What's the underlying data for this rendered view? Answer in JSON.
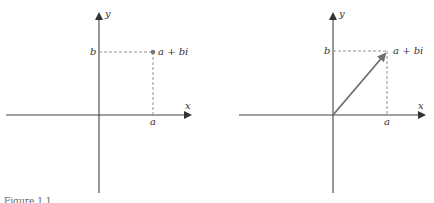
{
  "figure": {
    "caption_partial": "Figure 1.1",
    "panels": [
      {
        "id": "point-representation",
        "x_axis_label": "x",
        "y_axis_label": "y",
        "real_tick_label": "a",
        "imag_tick_label": "b",
        "point_label": "a + bi",
        "representation": "point"
      },
      {
        "id": "vector-representation",
        "x_axis_label": "x",
        "y_axis_label": "y",
        "real_tick_label": "a",
        "imag_tick_label": "b",
        "point_label": "a + bi",
        "representation": "vector"
      }
    ],
    "colors": {
      "axis": "#444444",
      "dashed": "#888888",
      "point": "#777777",
      "vector": "#6e6e6e"
    }
  }
}
